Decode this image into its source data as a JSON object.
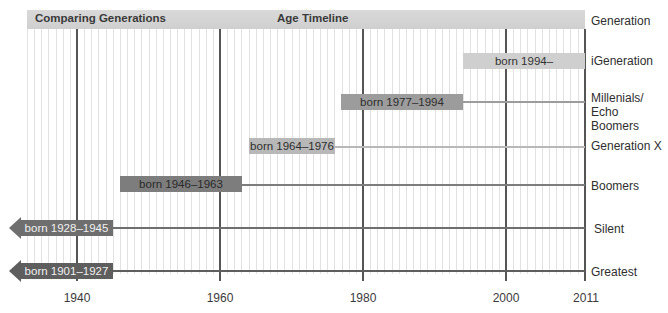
{
  "header": {
    "title": "Comparing Generations",
    "subtitle": "Age Timeline",
    "column_label": "Generation"
  },
  "axis": {
    "ticks": [
      {
        "label": "1940",
        "x": 77
      },
      {
        "label": "1960",
        "x": 220
      },
      {
        "label": "1980",
        "x": 363
      },
      {
        "label": "2000",
        "x": 506
      },
      {
        "label": "2011",
        "x": 585
      }
    ]
  },
  "generations": [
    {
      "name": "iGeneration",
      "bar_label": "born 1994–",
      "start": 1994,
      "end": null
    },
    {
      "name": "Millenials/ Echo Boomers",
      "name_line1": "Millenials/",
      "name_line2": "Echo Boomers",
      "bar_label": "born 1977–1994",
      "start": 1977,
      "end": 1994
    },
    {
      "name": "Generation X",
      "bar_label": "born 1964–1976",
      "start": 1964,
      "end": 1976
    },
    {
      "name": "Boomers",
      "bar_label": "born 1946–1963",
      "start": 1946,
      "end": 1963
    },
    {
      "name": "Silent",
      "bar_label": "born 1928–1945",
      "start": 1928,
      "end": 1945
    },
    {
      "name": "Greatest",
      "bar_label": "born 1901–1927",
      "start": 1901,
      "end": 1927
    }
  ],
  "colors": {
    "header": "#d3d3d3",
    "igen": "#cfcfcf",
    "millenial": "#9c9c9c",
    "genx": "#b8b8b8",
    "boomers": "#7d7d7d",
    "silent": "#6e6e6e",
    "greatest": "#5e5e5e",
    "grid_major": "#555555",
    "grid_minor": "#e2e2e2"
  },
  "chart_data": {
    "type": "timeline",
    "title": "Comparing Generations",
    "subtitle": "Age Timeline",
    "xlabel": "",
    "ylabel": "Generation",
    "xlim": [
      1933,
      2011
    ],
    "x_ticks": [
      1940,
      1960,
      1980,
      2000,
      2011
    ],
    "grid": true,
    "categories": [
      "iGeneration",
      "Millenials/Echo Boomers",
      "Generation X",
      "Boomers",
      "Silent",
      "Greatest"
    ],
    "series": [
      {
        "name": "iGeneration",
        "start": 1994,
        "end": null,
        "label": "born 1994–"
      },
      {
        "name": "Millenials/Echo Boomers",
        "start": 1977,
        "end": 1994,
        "label": "born 1977–1994"
      },
      {
        "name": "Generation X",
        "start": 1964,
        "end": 1976,
        "label": "born 1964–1976"
      },
      {
        "name": "Boomers",
        "start": 1946,
        "end": 1963,
        "label": "born 1946–1963"
      },
      {
        "name": "Silent",
        "start": 1928,
        "end": 1945,
        "label": "born 1928–1945",
        "extends_off_chart": true
      },
      {
        "name": "Greatest",
        "start": 1901,
        "end": 1927,
        "label": "born 1901–1927",
        "extends_off_chart": true
      }
    ]
  }
}
